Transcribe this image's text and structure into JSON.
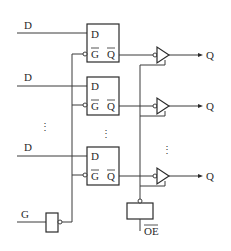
{
  "diagram": {
    "type": "octal transparent latch with tri-state outputs (logic diagram)",
    "inputs": {
      "data_label": "D",
      "gate_label": "G",
      "output_enable_label": "OE",
      "output_enable_active_low": true
    },
    "outputs": {
      "q_label": "Q"
    },
    "latch": {
      "pin_d": "D",
      "pin_g": "G",
      "pin_g_inverted": true,
      "pin_q": "Q",
      "pin_q_inverted": true
    },
    "stages": [
      {
        "d_label": "D",
        "latch_d": "D",
        "latch_g": "G",
        "latch_q": "Q",
        "q_label": "Q"
      },
      {
        "d_label": "D",
        "latch_d": "D",
        "latch_g": "G",
        "latch_q": "Q",
        "q_label": "Q"
      },
      {
        "d_label": "D",
        "latch_d": "D",
        "latch_g": "G",
        "latch_q": "Q",
        "q_label": "Q"
      }
    ],
    "ellipsis": "⋮",
    "colors": {
      "line": "#2a2a2a",
      "background": "#ffffff"
    }
  }
}
